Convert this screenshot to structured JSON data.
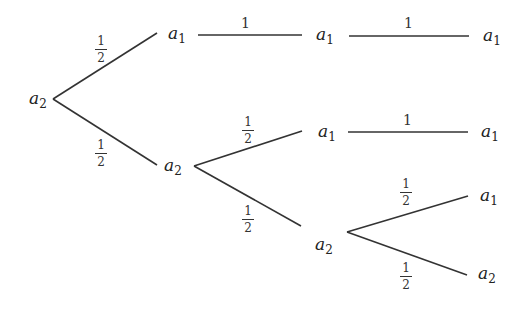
{
  "diagram": {
    "type": "probability-tree",
    "edge_color": "#333333",
    "nodes": [
      {
        "id": "root",
        "symbol": "a",
        "index": "2"
      },
      {
        "id": "n1",
        "symbol": "a",
        "index": "1"
      },
      {
        "id": "n2",
        "symbol": "a",
        "index": "2"
      },
      {
        "id": "n11",
        "symbol": "a",
        "index": "1"
      },
      {
        "id": "n111",
        "symbol": "a",
        "index": "1"
      },
      {
        "id": "n21",
        "symbol": "a",
        "index": "1"
      },
      {
        "id": "n211",
        "symbol": "a",
        "index": "1"
      },
      {
        "id": "n22",
        "symbol": "a",
        "index": "2"
      },
      {
        "id": "n221",
        "symbol": "a",
        "index": "1"
      },
      {
        "id": "n222",
        "symbol": "a",
        "index": "2"
      }
    ],
    "edges": [
      {
        "from": "root",
        "to": "n1",
        "prob": {
          "num": "1",
          "den": "2"
        }
      },
      {
        "from": "root",
        "to": "n2",
        "prob": {
          "num": "1",
          "den": "2"
        }
      },
      {
        "from": "n1",
        "to": "n11",
        "prob": "1"
      },
      {
        "from": "n11",
        "to": "n111",
        "prob": "1"
      },
      {
        "from": "n2",
        "to": "n21",
        "prob": {
          "num": "1",
          "den": "2"
        }
      },
      {
        "from": "n2",
        "to": "n22",
        "prob": {
          "num": "1",
          "den": "2"
        }
      },
      {
        "from": "n21",
        "to": "n211",
        "prob": "1"
      },
      {
        "from": "n22",
        "to": "n221",
        "prob": {
          "num": "1",
          "den": "2"
        }
      },
      {
        "from": "n22",
        "to": "n222",
        "prob": {
          "num": "1",
          "den": "2"
        }
      }
    ]
  }
}
